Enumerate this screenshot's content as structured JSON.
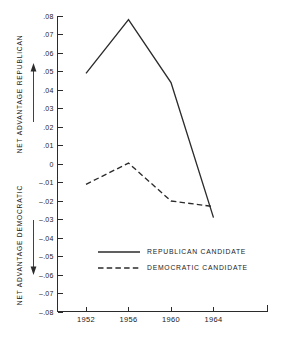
{
  "chart_data": {
    "type": "line",
    "title": "",
    "subtitle": "",
    "xlabel": "",
    "ylabel": "NET ADVANTAGE",
    "axis_titles": {
      "upper": "NET ADVANTAGE REPUBLICAN",
      "lower": "NET ADVANTAGE DEMOCRATIC"
    },
    "categories": [
      "1952",
      "1956",
      "1960",
      "1964"
    ],
    "x": [
      1952,
      1956,
      1960,
      1964
    ],
    "series": [
      {
        "name": "REPUBLICAN CANDIDATE",
        "style": "solid",
        "color": "#2b2b2b",
        "values": [
          0.049,
          0.078,
          0.044,
          -0.029
        ]
      },
      {
        "name": "DEMOCRATIC CANDIDATE",
        "style": "dashed",
        "color": "#2b2b2b",
        "values": [
          -0.011,
          0.0005,
          -0.02,
          -0.023
        ]
      }
    ],
    "ylim": [
      -0.08,
      0.08
    ],
    "ytick_values": [
      0.08,
      0.07,
      0.06,
      0.05,
      0.04,
      0.03,
      0.02,
      0.01,
      0,
      -0.01,
      -0.02,
      -0.03,
      -0.04,
      -0.05,
      -0.06,
      -0.07,
      -0.08
    ],
    "ytick_labels": [
      ".08",
      ".07",
      ".06",
      ".05",
      ".04",
      ".03",
      ".02",
      ".01",
      "0",
      "–.01",
      "–.02",
      "–.03",
      "–.04",
      "–.05",
      "–.06",
      "–.07",
      "–.08"
    ],
    "xtick_labels": [
      "1952",
      "1956",
      "1960",
      "1964"
    ],
    "grid": false,
    "legend_position": "inside-lower-center",
    "annotations": [
      {
        "name": "up-arrow-republican",
        "meaning": "increasing republican advantage"
      },
      {
        "name": "down-arrow-democratic",
        "meaning": "increasing democratic advantage"
      }
    ]
  },
  "legend": {
    "entries": [
      {
        "label": "REPUBLICAN CANDIDATE",
        "style": "solid"
      },
      {
        "label": "DEMOCRATIC CANDIDATE",
        "style": "dashed"
      }
    ]
  },
  "colors": {
    "ink": "#2b2b2b",
    "background": "#ffffff"
  }
}
